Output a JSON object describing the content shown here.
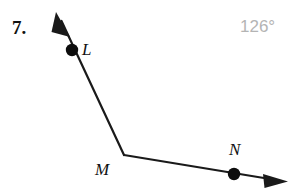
{
  "figure": {
    "problem_number": "7.",
    "angle_measure": "126°",
    "angle_measure_color": "#b4b4b4",
    "stroke_color": "#1a1a1a",
    "background_color": "#ffffff",
    "canvas": {
      "width": 295,
      "height": 193
    },
    "points": [
      {
        "name": "L",
        "label": "L",
        "dot_x": 72,
        "dot_y": 50,
        "dot_radius": 6,
        "label_x": 82,
        "label_y": 41
      },
      {
        "name": "M",
        "label": "M",
        "dot_x": 124,
        "dot_y": 155,
        "dot_radius": 0,
        "label_x": 95,
        "label_y": 161
      },
      {
        "name": "N",
        "label": "N",
        "dot_x": 234,
        "dot_y": 174,
        "dot_radius": 6,
        "label_x": 229,
        "label_y": 141
      }
    ],
    "rays": [
      {
        "name": "ray-ML",
        "from": "M",
        "through": "L",
        "x1": 124,
        "y1": 155,
        "x2": 62,
        "y2": 22,
        "arrow_tip_x": 56,
        "arrow_tip_y": 13,
        "arrow_angle_deg": 245,
        "stroke_width": 2.2
      },
      {
        "name": "ray-MN",
        "from": "M",
        "through": "N",
        "x1": 124,
        "y1": 155,
        "x2": 272,
        "y2": 179,
        "arrow_tip_x": 287,
        "arrow_tip_y": 181,
        "arrow_angle_deg": 9,
        "stroke_width": 2.2
      }
    ],
    "geometry": {
      "vertex": "M",
      "angle_name": "LMN",
      "angle_degrees": 126
    }
  }
}
